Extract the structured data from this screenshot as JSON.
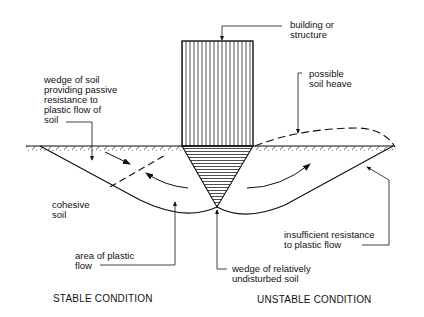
{
  "labels": {
    "building": "building or\nstructure",
    "passive_wedge": "wedge of soil\nproviding passive\nresistance to\nplastic flow of\nsoil",
    "soil_heave": "possible\nsoil heave",
    "cohesive_soil": "cohesive\nsoil",
    "plastic_flow_area": "area of plastic\nflow",
    "insufficient_resistance": "insufficient resistance\nto plastic flow",
    "undisturbed_wedge": "wedge of relatively\nundisturbed soil"
  },
  "captions": {
    "left": "STABLE CONDITION",
    "right": "UNSTABLE CONDITION"
  },
  "colors": {
    "ink": "#111111",
    "background": "#ffffff"
  }
}
